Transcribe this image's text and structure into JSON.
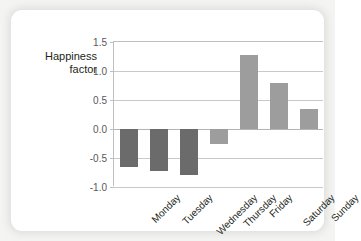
{
  "chart_data": {
    "type": "bar",
    "title": "",
    "xlabel": "",
    "ylabel": "Happiness\nfactor",
    "categories": [
      "Monday",
      "Tuesday",
      "Wednesday",
      "Thursday",
      "Friday",
      "Saturday",
      "Sunday"
    ],
    "values": [
      -0.65,
      -0.72,
      -0.79,
      -0.26,
      1.28,
      0.8,
      0.35
    ],
    "series": [
      {
        "name": "Happiness factor",
        "values": [
          -0.65,
          -0.72,
          -0.79,
          -0.26,
          1.28,
          0.8,
          0.35
        ]
      }
    ],
    "ylim": [
      -1.0,
      1.5
    ],
    "yticks": [
      "1.5",
      "1.0",
      "0.5",
      "0.0",
      "-0.5",
      "-1.0"
    ],
    "ytick_values": [
      1.5,
      1.0,
      0.5,
      0.0,
      -0.5,
      -1.0
    ],
    "grid": true,
    "legend": "none",
    "bar_colors": [
      "#6b6b6b",
      "#6b6b6b",
      "#6b6b6b",
      "#9d9d9d",
      "#9d9d9d",
      "#9d9d9d",
      "#9d9d9d"
    ],
    "colors": {
      "bar_dark": "#6b6b6b",
      "bar_light": "#9d9d9d",
      "axis": "#bfbfbf",
      "grid": "#c9c9c9",
      "text": "#231f20",
      "tick_text": "#58595b",
      "card": "#ffffff",
      "page_background": "#f4f4f2"
    }
  }
}
